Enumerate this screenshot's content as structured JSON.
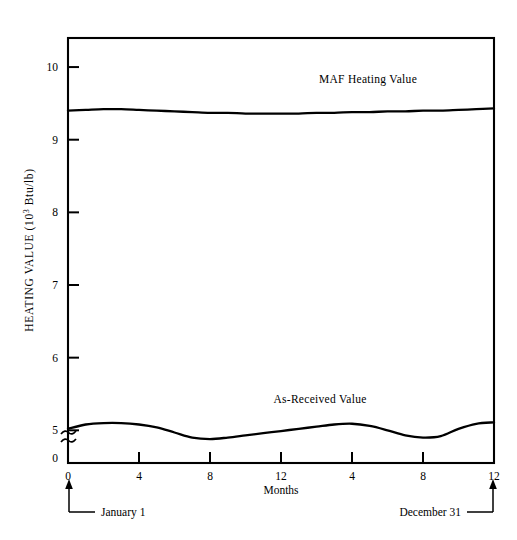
{
  "chart_data": {
    "type": "line",
    "title": "",
    "xlabel": "Months",
    "ylabel": "HEATING VALUE (10",
    "ylabel_exponent": "3",
    "ylabel_suffix": " Btu/lb)",
    "grid": false,
    "legend_position": "inline-labels",
    "xlim": [
      0,
      24
    ],
    "ylim": [
      4.55,
      10.4
    ],
    "y_axis_break": true,
    "y_break_symbol": "≈",
    "y_zero_label": "0",
    "xticks": [
      0,
      4,
      8,
      12,
      16,
      20,
      24
    ],
    "xtick_labels": [
      "0",
      "4",
      "8",
      "12",
      "4",
      "8",
      "12"
    ],
    "yticks": [
      5,
      6,
      7,
      8,
      9,
      10
    ],
    "ytick_labels": [
      "5",
      "6",
      "7",
      "8",
      "9",
      "10"
    ],
    "x": [
      0,
      1,
      2,
      3,
      4,
      5,
      6,
      7,
      8,
      9,
      10,
      11,
      12,
      13,
      14,
      15,
      16,
      17,
      18,
      19,
      20,
      21,
      22,
      23,
      24
    ],
    "series": [
      {
        "name": "MAF Heating Value",
        "label": "MAF Heating Value",
        "label_x": 16.9,
        "label_y": 9.78,
        "values": [
          9.4,
          9.41,
          9.42,
          9.42,
          9.41,
          9.4,
          9.39,
          9.38,
          9.37,
          9.37,
          9.36,
          9.36,
          9.36,
          9.36,
          9.37,
          9.37,
          9.38,
          9.38,
          9.39,
          9.39,
          9.4,
          9.4,
          9.41,
          9.42,
          9.43
        ]
      },
      {
        "name": "As-Received Value",
        "label": "As-Received Value",
        "label_x": 14.2,
        "label_y": 5.38,
        "values": [
          5.02,
          5.08,
          5.1,
          5.1,
          5.08,
          5.04,
          4.97,
          4.9,
          4.88,
          4.9,
          4.93,
          4.96,
          4.99,
          5.02,
          5.05,
          5.08,
          5.09,
          5.06,
          5.0,
          4.93,
          4.9,
          4.92,
          5.02,
          5.09,
          5.11
        ]
      }
    ],
    "annotations": [
      {
        "name": "january-1",
        "text": "January 1",
        "at_x": 0,
        "side": "left"
      },
      {
        "name": "december-31",
        "text": "December 31",
        "at_x": 24,
        "side": "right"
      }
    ]
  }
}
